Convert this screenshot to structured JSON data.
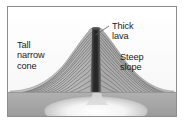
{
  "figure": {
    "frame_color": "#8d8d8d",
    "background_color": "#fcfcfc"
  },
  "labels": {
    "tall_narrow_cone": "Tall\nnarrow\ncone",
    "thick_lava": "Thick\nlava",
    "steep_slope": "Steep\nslope"
  },
  "diagram": {
    "sky_color": "#fbfbfb",
    "ground_color": "#a9a9a9",
    "cone_color": "#b4b4b4",
    "layer_line_color": "#6e6e6e",
    "conduit_color": "#3a3a3a",
    "magma_chamber_color": "#f2f2f2",
    "leader_line_color": "#5a5a5a",
    "parts": [
      {
        "name": "volcanic-cone",
        "label": "Tall narrow cone"
      },
      {
        "name": "lava-layers",
        "label": "Alternating lava and ash layers"
      },
      {
        "name": "central-conduit",
        "label": "Thick lava"
      },
      {
        "name": "crater",
        "label": "Summit crater"
      },
      {
        "name": "ground-surface",
        "label": "Ground surface"
      },
      {
        "name": "magma-chamber",
        "label": "Magma chamber"
      }
    ],
    "layer_count": 13,
    "cone": {
      "peak_x": 92,
      "peak_y": 26,
      "base_left_x": 10,
      "base_right_x": 172,
      "base_y": 88
    }
  }
}
